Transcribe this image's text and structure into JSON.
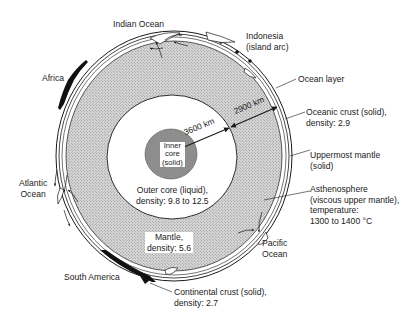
{
  "colors": {
    "background": "#ffffff",
    "line": "#1a1a1a",
    "mantle_stipple": "#c9c9c9",
    "inner_core": "#8f8f8f",
    "continent": "#111111",
    "text": "#222222"
  },
  "layers": {
    "inner_core": {
      "label_lines": [
        "Inner",
        "core",
        "(solid)"
      ]
    },
    "outer_core": {
      "label_lines": [
        "Outer core (liquid),",
        "density: 9.8 to 12.5"
      ]
    },
    "mantle": {
      "label_lines": [
        "Mantle,",
        "density: 5.6"
      ]
    }
  },
  "distances": {
    "core_radius": "3600 km",
    "mantle_thickness": "2900 km"
  },
  "callouts": {
    "ocean_layer": {
      "lines": [
        "Ocean layer"
      ]
    },
    "oceanic_crust": {
      "lines": [
        "Oceanic crust (solid),",
        "density: 2.9"
      ]
    },
    "uppermost_mantle": {
      "lines": [
        "Uppermost mantle",
        "(solid)"
      ]
    },
    "asthenosphere": {
      "lines": [
        "Asthenosphere",
        "(viscous upper mantle),",
        "temperature:",
        "1300 to 1400 °C"
      ]
    },
    "continental_crust": {
      "lines": [
        "Continental crust (solid),",
        "density: 2.7"
      ]
    }
  },
  "places": {
    "indian_ocean": {
      "lines": [
        "Indian Ocean"
      ]
    },
    "indonesia": {
      "lines": [
        "Indonesia",
        "(island arc)"
      ]
    },
    "africa": {
      "lines": [
        "Africa"
      ]
    },
    "atlantic_ocean": {
      "lines": [
        "Atlantic",
        "Ocean"
      ]
    },
    "pacific_ocean": {
      "lines": [
        "Pacific",
        "Ocean"
      ]
    },
    "south_america": {
      "lines": [
        "South America"
      ]
    }
  }
}
